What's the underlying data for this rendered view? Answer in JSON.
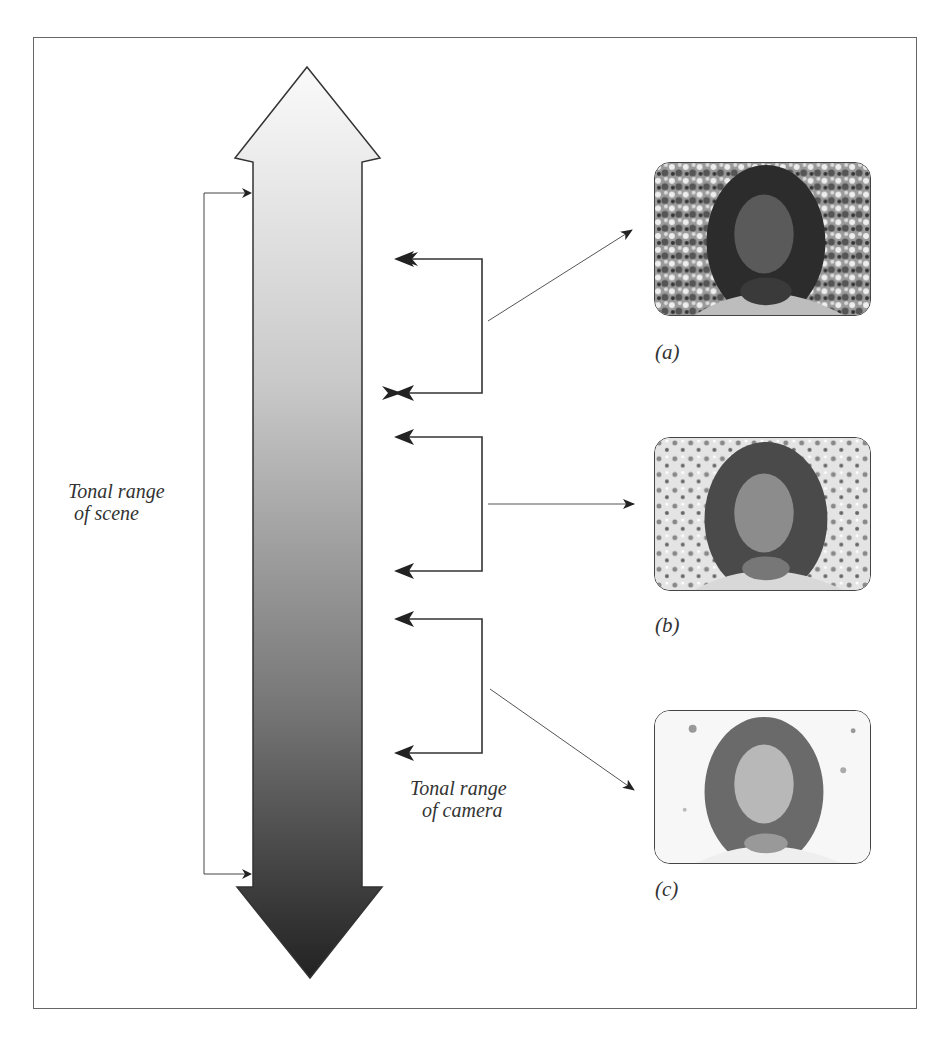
{
  "figure": {
    "scene_label_line1": "Tonal range",
    "scene_label_line2": "of scene",
    "camera_label_line1": "Tonal range",
    "camera_label_line2": "of camera",
    "gradient": {
      "top_color": "#f8f8f8",
      "bottom_color": "#2a2a2a"
    },
    "brackets": [
      {
        "id": "a",
        "top_y": 259,
        "bottom_y": 393,
        "target": "photo-a"
      },
      {
        "id": "b",
        "top_y": 437,
        "bottom_y": 571,
        "target": "photo-b"
      },
      {
        "id": "c",
        "top_y": 619,
        "bottom_y": 753,
        "target": "photo-c"
      }
    ],
    "photos": [
      {
        "id": "a",
        "caption": "(a)",
        "description": "Portrait exposed for highlights; dark, contrasty background"
      },
      {
        "id": "b",
        "caption": "(b)",
        "description": "Portrait exposed for midtones"
      },
      {
        "id": "c",
        "caption": "(c)",
        "description": "Portrait exposed for shadows; background blown out to white"
      }
    ]
  }
}
